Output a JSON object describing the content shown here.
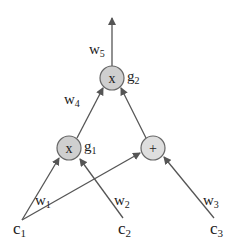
{
  "diagram": {
    "type": "computation-graph",
    "colors": {
      "edge": "#555555",
      "node_fill": "#cfcfcf",
      "node_stroke": "#666666",
      "text": "#222222"
    },
    "nodes": [
      {
        "id": "g2",
        "op": "x",
        "label": "g",
        "label_sub": "2"
      },
      {
        "id": "g1",
        "op": "x",
        "label": "g",
        "label_sub": "1"
      },
      {
        "id": "plus",
        "op": "+",
        "label": "",
        "label_sub": ""
      }
    ],
    "inputs": [
      {
        "id": "c1",
        "label": "c",
        "label_sub": "1"
      },
      {
        "id": "c2",
        "label": "c",
        "label_sub": "2"
      },
      {
        "id": "c3",
        "label": "c",
        "label_sub": "3"
      }
    ],
    "edges": [
      {
        "from": "c1",
        "to": "g1",
        "weight": "w",
        "weight_sub": "1"
      },
      {
        "from": "c2",
        "to": "g1",
        "weight": "w",
        "weight_sub": "2"
      },
      {
        "from": "c1",
        "to": "plus",
        "weight": "",
        "weight_sub": ""
      },
      {
        "from": "c3",
        "to": "plus",
        "weight": "w",
        "weight_sub": "3"
      },
      {
        "from": "g1",
        "to": "g2",
        "weight": "w",
        "weight_sub": "4"
      },
      {
        "from": "plus",
        "to": "g2",
        "weight": "",
        "weight_sub": ""
      },
      {
        "from": "g2",
        "to": "output",
        "weight": "w",
        "weight_sub": "5"
      }
    ]
  }
}
